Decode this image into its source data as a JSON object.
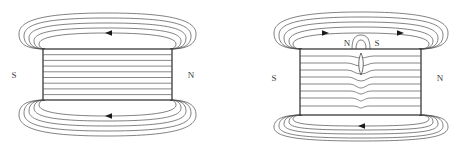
{
  "figure": {
    "background_color": "#ffffff",
    "line_color": "#4a4a4a",
    "magnet_outline_color": "#3a3a3a",
    "label_color": "#3a3a3a"
  },
  "panels": [
    {
      "id": "intact-magnet",
      "name": "Intact bar magnet",
      "magnet": {
        "x": 43,
        "y": 49,
        "width": 129,
        "height": 51,
        "internal_line_count": 8
      },
      "labels": {
        "left_pole": "S",
        "right_pole": "N"
      },
      "label_positions": {
        "left_pole": {
          "x": 14,
          "y": 78
        },
        "right_pole": {
          "x": 191,
          "y": 78
        }
      },
      "field_loop_count": 4,
      "arrows": [
        {
          "x": 110,
          "y": 33,
          "direction": "left"
        },
        {
          "x": 110,
          "y": 116,
          "direction": "left"
        }
      ]
    },
    {
      "id": "cracked-magnet",
      "name": "Bar magnet with transverse crack",
      "magnet": {
        "x": 300,
        "y": 49,
        "width": 121,
        "height": 66,
        "internal_line_count": 8
      },
      "labels": {
        "left_pole": "S",
        "right_pole": "N",
        "crack_left_pole": "N",
        "crack_right_pole": "S"
      },
      "label_positions": {
        "left_pole": {
          "x": 274,
          "y": 81
        },
        "right_pole": {
          "x": 440,
          "y": 81
        },
        "crack_left_pole": {
          "x": 345,
          "y": 45
        },
        "crack_right_pole": {
          "x": 377,
          "y": 45
        }
      },
      "crack": {
        "center_x": 361,
        "top_y": 53,
        "bottom_y": 75,
        "shape": "lens"
      },
      "field_loop_count": 4,
      "arrows": [
        {
          "x": 325,
          "y": 33,
          "direction": "right"
        },
        {
          "x": 400,
          "y": 33,
          "direction": "right"
        },
        {
          "x": 361,
          "y": 119,
          "direction": "left"
        }
      ]
    }
  ]
}
